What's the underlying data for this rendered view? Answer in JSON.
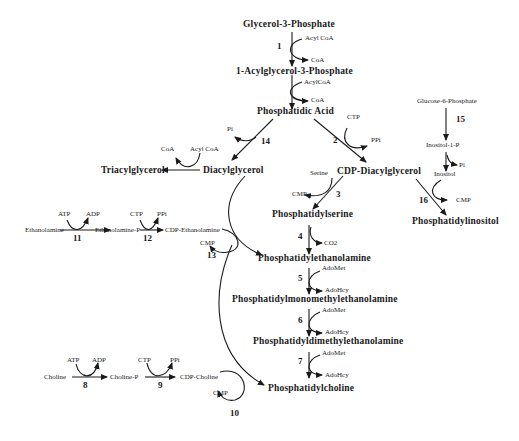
{
  "diagram": {
    "type": "metabolic-pathway",
    "compounds": {
      "g3p": "Glycerol-3-Phosphate",
      "lpa": "1-Acylglycerol-3-Phosphate",
      "pa": "Phosphatidic  Acid",
      "dag": "Diacylglycerol",
      "tag": "Triacylglycerol",
      "cdpdag": "CDP-Diacylglycerol",
      "ps": "Phosphatidylserine",
      "pe": "Phosphatidylethanolamine",
      "pme": "Phosphatidylmonomethylethanolamine",
      "pde": "Phosphatidyldimethylethanolamine",
      "pc": "Phosphatidylcholine",
      "pi": "Phosphatidylinositol",
      "g6p": "Glucose-6-Phosphate",
      "ino1p": "Inositol-1-P",
      "inositol": "Inositol",
      "etn": "Ethanolamine",
      "etnp": "Ethanolamine-P",
      "cdpetn": "CDP-Ethanolamine",
      "cho": "Choline",
      "chop": "Choline-P",
      "cdpcho": "CDP-Choline"
    },
    "cofactors": {
      "r1_in": "Acyl CoA",
      "r1_out": "CoA",
      "r1b_in": "AcylCoA",
      "r1b_out": "CoA",
      "r2_in": "CTP",
      "r2_out": "PPi",
      "r14_out": "Pi",
      "tag_in": "Acyl CoA",
      "tag_out": "CoA",
      "r3_in": "Serine",
      "r3_out": "CMP",
      "r4_out": "CO2",
      "r5_in": "AdoMet",
      "r5_out": "AdoHcy",
      "r6_in": "AdoMet",
      "r6_out": "AdoHcy",
      "r7_in": "AdoMet",
      "r7_out": "AdoHcy",
      "r11_in": "ATP",
      "r11_out": "ADP",
      "r12_in": "CTP",
      "r12_out": "PPi",
      "r13_out": "CMP",
      "r8_in": "ATP",
      "r8_out": "ADP",
      "r9_in": "CTP",
      "r9_out": "PPi",
      "r10_out": "CMP",
      "r15b_out": "Pi",
      "r16_out": "CMP"
    },
    "reactions": {
      "r1": "1",
      "r2": "2",
      "r3": "3",
      "r4": "4",
      "r5": "5",
      "r6": "6",
      "r7": "7",
      "r8": "8",
      "r9": "9",
      "r10": "10",
      "r11": "11",
      "r12": "12",
      "r13": "13",
      "r14": "14",
      "r15": "15",
      "r16": "16"
    },
    "colors": {
      "ink": "#1a1a1a",
      "background": "#ffffff"
    }
  }
}
